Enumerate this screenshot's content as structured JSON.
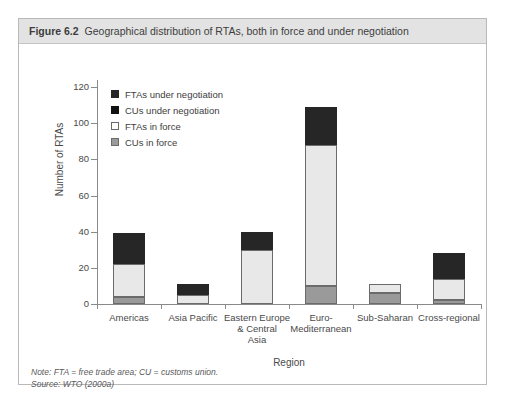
{
  "figure": {
    "number": "Figure 6.2",
    "title": "Geographical distribution of RTAs, both in force and under negotiation"
  },
  "notes": {
    "note": "Note: FTA = free trade area; CU = customs union.",
    "source": "Source: WTO (2000a)"
  },
  "colors": {
    "cus_in_force": "#9a9a9a",
    "ftas_in_force": "#e8e8e8",
    "cus_under_negotiation": "#111111",
    "ftas_under_negotiation": "#262626",
    "axis": "#8a8a8a",
    "header_band": "#e3e3e3",
    "frame": "#b9b9b9"
  },
  "chart_data": {
    "type": "bar",
    "stacked": true,
    "title": "Geographical distribution of RTAs, both in force and under negotiation",
    "xlabel": "Region",
    "ylabel": "Number of RTAs",
    "ylim": [
      0,
      120
    ],
    "yticks": [
      0,
      20,
      40,
      60,
      80,
      100,
      120
    ],
    "grid": false,
    "legend_position": "inside-top-left",
    "categories": [
      "Americas",
      "Asia Pacific",
      "Eastern Europe & Central Asia",
      "Euro-Mediterranean",
      "Sub-Saharan",
      "Cross-regional"
    ],
    "category_labels": [
      [
        "Americas"
      ],
      [
        "Asia Pacific"
      ],
      [
        "Eastern Europe",
        "& Central",
        "Asia"
      ],
      [
        "Euro-",
        "Mediterranean"
      ],
      [
        "Sub-Saharan"
      ],
      [
        "Cross-regional"
      ]
    ],
    "series": [
      {
        "name": "CUs in force",
        "values": [
          4,
          0,
          0,
          10,
          6,
          2
        ]
      },
      {
        "name": "FTAs in force",
        "values": [
          18,
          5,
          30,
          78,
          5,
          12
        ]
      },
      {
        "name": "CUs under negotiation",
        "values": [
          0,
          0,
          0,
          0,
          0,
          0
        ]
      },
      {
        "name": "FTAs under negotiation",
        "values": [
          17,
          6,
          10,
          21,
          0,
          14
        ]
      }
    ],
    "totals": [
      39,
      11,
      40,
      109,
      11,
      28
    ]
  },
  "legend": {
    "items": [
      {
        "label": "FTAs under negotiation",
        "swatch": "#262626",
        "border": "#262626"
      },
      {
        "label": "CUs under negotiation",
        "swatch": "#111111",
        "border": "#111111"
      },
      {
        "label": "FTAs in force",
        "swatch": "#ffffff",
        "border": "#6b6b6b"
      },
      {
        "label": "CUs in force",
        "swatch": "#9a9a9a",
        "border": "#6b6b6b"
      }
    ]
  }
}
